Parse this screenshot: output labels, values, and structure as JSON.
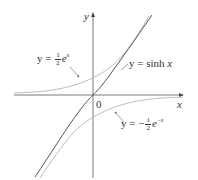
{
  "figure": {
    "axes": {
      "x_label": "x",
      "y_label": "y",
      "origin_label": "0"
    },
    "curves": [
      {
        "name": "sinh",
        "label_prefix": "y = sinh ",
        "label_var": "x",
        "color": "#555555"
      },
      {
        "name": "half_exp",
        "label_prefix": "y = ",
        "frac_num": "1",
        "frac_den": "2",
        "base": "e",
        "exponent": "x",
        "color": "#b8b8b8"
      },
      {
        "name": "neg_half_exp_neg",
        "label_prefix": "y = −",
        "frac_num": "1",
        "frac_den": "2",
        "base": "e",
        "exponent": "−x",
        "color": "#b8b8b8"
      }
    ],
    "colors": {
      "axis": "#555555",
      "text": "#333333",
      "sinh_curve": "#555555",
      "exp_curves": "#b8b8b8"
    }
  }
}
